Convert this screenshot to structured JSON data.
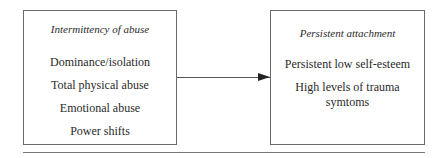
{
  "diagram": {
    "left_box": {
      "title": "Intermittency of abuse",
      "items": [
        "Dominance/isolation",
        "Total physical abuse",
        "Emotional abuse",
        "Power shifts"
      ]
    },
    "right_box": {
      "title": "Persistent attachment",
      "items": [
        "Persistent low self-esteem",
        "High levels of trauma symtoms"
      ]
    },
    "arrow": {
      "from": "left_box",
      "to": "right_box",
      "direction": "right"
    }
  }
}
